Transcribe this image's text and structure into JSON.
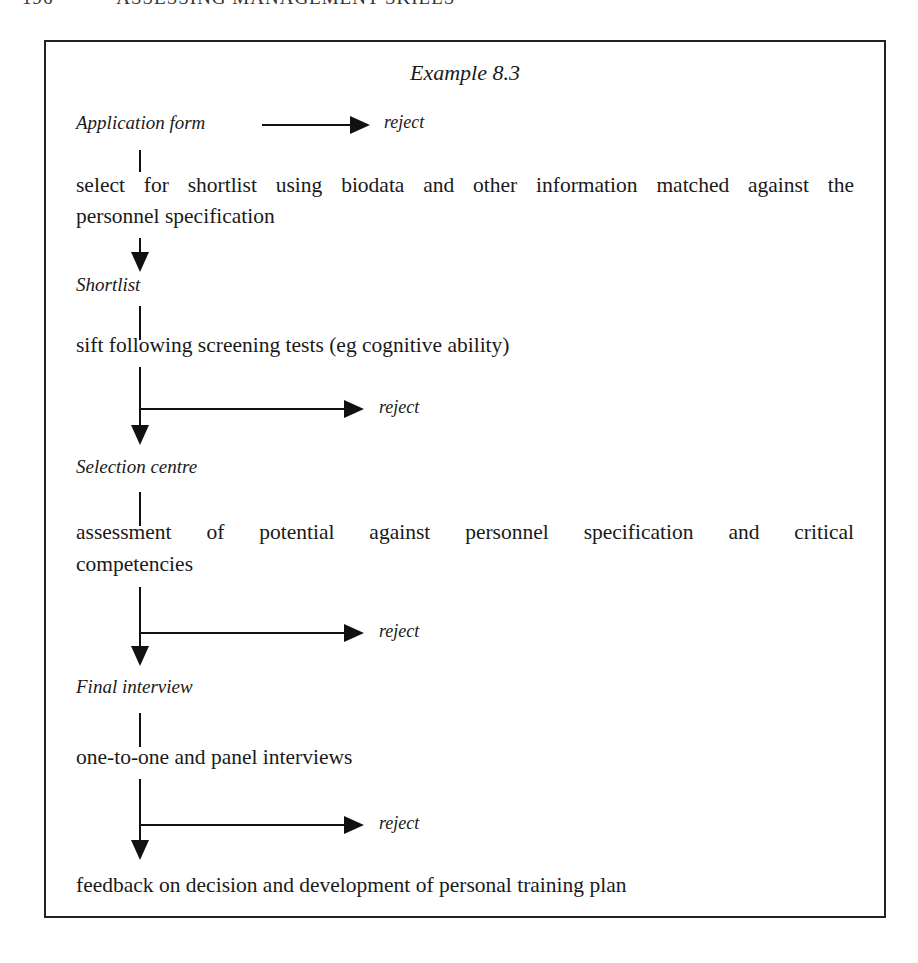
{
  "page_header": {
    "page_number": "196",
    "running_title": "ASSESSING MANAGEMENT SKILLS"
  },
  "figure": {
    "title": "Example 8.3",
    "reject_label": "reject",
    "flow": [
      {
        "type": "stage",
        "label": "Application form",
        "reject": true
      },
      {
        "type": "step",
        "text_line1": "select for shortlist using biodata and other information matched against the",
        "text_line2": "personnel specification"
      },
      {
        "type": "stage",
        "label": "Shortlist"
      },
      {
        "type": "step",
        "text": "sift following screening tests (eg cognitive ability)",
        "reject": true
      },
      {
        "type": "stage",
        "label": "Selection centre"
      },
      {
        "type": "step",
        "text_line1": "assessment of potential against personnel specification and critical",
        "text_line2": "competencies",
        "reject": true
      },
      {
        "type": "stage",
        "label": "Final interview"
      },
      {
        "type": "step",
        "text": "one-to-one and panel interviews",
        "reject": true
      },
      {
        "type": "step",
        "text": "feedback on decision and development of personal training plan"
      }
    ]
  }
}
